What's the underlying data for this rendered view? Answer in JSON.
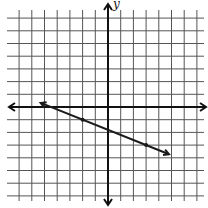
{
  "chart_data": {
    "type": "line",
    "title": "",
    "xlabel": "x",
    "ylabel": "y",
    "xlim": [
      -7,
      7
    ],
    "ylim": [
      -7,
      7
    ],
    "grid": true,
    "grid_step": 1,
    "axes_arrows": true,
    "tick_labels": false,
    "series": [
      {
        "name": "line",
        "kind": "line-with-arrows",
        "points": [
          {
            "x": -2,
            "y": -1
          },
          {
            "x": 3,
            "y": -3
          }
        ],
        "slope": -0.4,
        "y_intercept": -1.8,
        "extent_x": [
          -5.3,
          4.8
        ]
      }
    ],
    "colors": {
      "grid": "#555555",
      "axis": "#111111",
      "line": "#1a1a1a",
      "background": "#ffffff"
    }
  },
  "labels": {
    "y_axis": "y"
  }
}
